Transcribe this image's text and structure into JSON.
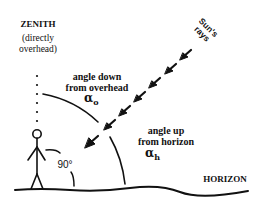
{
  "diagram": {
    "zenith": {
      "title": "ZENITH",
      "subtitle_line1": "(directly",
      "subtitle_line2": "overhead)"
    },
    "sun_rays": {
      "label_line1": "Sun's",
      "label_line2": "rays",
      "arrow_count": 6
    },
    "angle_down": {
      "label_line1": "angle down",
      "label_line2": "from overhead",
      "symbol": "α",
      "symbol_subscript": "o"
    },
    "angle_up": {
      "label_line1": "angle up",
      "label_line2": "from horizon",
      "symbol": "α",
      "symbol_subscript": "h"
    },
    "right_angle": {
      "label": "90°"
    },
    "horizon": {
      "label": "HORIZON"
    },
    "colors": {
      "ink": "#111111",
      "background": "#ffffff"
    }
  }
}
